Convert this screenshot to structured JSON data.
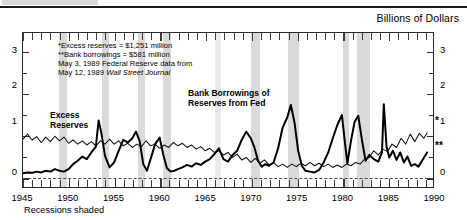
{
  "header": {
    "units_label": "Billions of Dollars"
  },
  "footer": {
    "recessions_note": "Recessions shaded"
  },
  "annotations": {
    "note_line1": "*Excess reserves = $1,251 million",
    "note_line2": "**Bank borrowings = $581 million",
    "note_line3": "May 3, 1989 Federal Reserve data from",
    "note_line4_prefix": "May 12, 1989 ",
    "note_line4_italic": "Wall Street Journal",
    "series_label_excess": "Excess",
    "series_label_excess2": "Reserves",
    "series_label_borrow": "Bank Borrowings of",
    "series_label_borrow2": "Reserves from Fed",
    "endmark_excess": "*",
    "endmark_borrow": "**"
  },
  "colors": {
    "line": "#000000",
    "recession_band": "#c3c3c3",
    "axis": "#2a2a2a",
    "background": "#ffffff"
  },
  "chart_data": {
    "type": "line",
    "title": "",
    "subtitle": "",
    "xlabel": "",
    "ylabel": "Billions of Dollars",
    "ylim": [
      -0.25,
      3.45
    ],
    "xlim": [
      1945,
      1990
    ],
    "grid": false,
    "legend": "inline-annotations",
    "yticks": [
      0,
      1,
      2,
      3
    ],
    "yticks_minor": [
      0.5,
      1.5,
      2.5
    ],
    "xticks": [
      1945,
      1950,
      1955,
      1960,
      1965,
      1970,
      1975,
      1980,
      1985,
      1990
    ],
    "xticks_minor_step": 1,
    "zero_line": 0,
    "recessions": [
      {
        "start": 1948.9,
        "end": 1949.8
      },
      {
        "start": 1953.6,
        "end": 1954.4
      },
      {
        "start": 1957.6,
        "end": 1958.3
      },
      {
        "start": 1960.3,
        "end": 1961.2
      },
      {
        "start": 1966.0,
        "end": 1966.6,
        "light": true
      },
      {
        "start": 1969.9,
        "end": 1970.9
      },
      {
        "start": 1973.9,
        "end": 1975.2
      },
      {
        "start": 1980.0,
        "end": 1980.6
      },
      {
        "start": 1981.5,
        "end": 1982.9
      }
    ],
    "series": [
      {
        "name": "Excess Reserves",
        "style": "thin",
        "end_value": 1.251,
        "end_marker": "*",
        "x": [
          1945.0,
          1945.5,
          1946.0,
          1946.5,
          1947.0,
          1947.5,
          1948.0,
          1948.5,
          1949.0,
          1949.5,
          1950.0,
          1950.5,
          1951.0,
          1951.5,
          1952.0,
          1952.5,
          1953.0,
          1953.5,
          1954.0,
          1954.5,
          1955.0,
          1955.5,
          1956.0,
          1956.5,
          1957.0,
          1957.5,
          1958.0,
          1958.5,
          1959.0,
          1959.5,
          1960.0,
          1960.5,
          1961.0,
          1961.5,
          1962.0,
          1962.5,
          1963.0,
          1963.5,
          1964.0,
          1964.5,
          1965.0,
          1965.5,
          1966.0,
          1966.5,
          1967.0,
          1967.5,
          1968.0,
          1968.5,
          1969.0,
          1969.5,
          1970.0,
          1970.5,
          1971.0,
          1971.5,
          1972.0,
          1972.5,
          1973.0,
          1973.5,
          1974.0,
          1974.5,
          1975.0,
          1975.5,
          1976.0,
          1976.5,
          1977.0,
          1977.5,
          1978.0,
          1978.5,
          1979.0,
          1979.5,
          1980.0,
          1980.5,
          1981.0,
          1981.5,
          1982.0,
          1982.5,
          1983.0,
          1983.5,
          1984.0,
          1984.5,
          1985.0,
          1985.5,
          1986.0,
          1986.5,
          1987.0,
          1987.5,
          1988.0,
          1988.5,
          1989.0,
          1989.35
        ],
        "y": [
          0.9,
          1.02,
          0.88,
          0.96,
          0.82,
          0.95,
          0.84,
          0.97,
          0.86,
          0.95,
          0.8,
          0.88,
          0.78,
          0.86,
          0.76,
          0.84,
          0.74,
          0.86,
          0.78,
          0.9,
          0.78,
          0.86,
          0.74,
          0.8,
          0.7,
          0.78,
          0.72,
          0.86,
          0.74,
          0.78,
          0.68,
          0.76,
          0.7,
          0.82,
          0.74,
          0.8,
          0.7,
          0.76,
          0.66,
          0.72,
          0.62,
          0.68,
          0.58,
          0.62,
          0.52,
          0.58,
          0.46,
          0.54,
          0.4,
          0.46,
          0.34,
          0.44,
          0.32,
          0.4,
          0.28,
          0.34,
          0.24,
          0.3,
          0.22,
          0.3,
          0.24,
          0.32,
          0.26,
          0.34,
          0.26,
          0.32,
          0.24,
          0.3,
          0.22,
          0.28,
          0.22,
          0.3,
          0.26,
          0.34,
          0.3,
          0.42,
          0.46,
          0.62,
          0.52,
          0.66,
          0.6,
          0.78,
          0.7,
          0.92,
          0.78,
          1.02,
          0.84,
          1.04,
          0.92,
          1.05
        ]
      },
      {
        "name": "Bank Borrowings of Reserves from Fed",
        "style": "thick",
        "end_value": 0.581,
        "end_marker": "**",
        "x": [
          1945.0,
          1945.5,
          1946.0,
          1946.5,
          1947.0,
          1947.5,
          1948.0,
          1948.5,
          1949.0,
          1949.5,
          1950.0,
          1950.5,
          1951.0,
          1951.5,
          1952.0,
          1952.5,
          1953.0,
          1953.3,
          1953.6,
          1954.0,
          1954.5,
          1955.0,
          1955.5,
          1956.0,
          1956.5,
          1957.0,
          1957.4,
          1957.8,
          1958.2,
          1958.6,
          1959.0,
          1959.5,
          1960.0,
          1960.4,
          1960.8,
          1961.2,
          1961.6,
          1962.0,
          1962.5,
          1963.0,
          1963.5,
          1964.0,
          1964.5,
          1965.0,
          1965.5,
          1966.0,
          1966.5,
          1967.0,
          1967.5,
          1968.0,
          1968.5,
          1969.0,
          1969.5,
          1970.0,
          1970.4,
          1970.8,
          1971.2,
          1971.6,
          1972.0,
          1972.5,
          1973.0,
          1973.5,
          1974.0,
          1974.4,
          1974.8,
          1975.2,
          1975.6,
          1976.0,
          1976.5,
          1977.0,
          1977.5,
          1978.0,
          1978.5,
          1979.0,
          1979.5,
          1980.0,
          1980.3,
          1980.6,
          1981.0,
          1981.4,
          1981.8,
          1982.2,
          1982.6,
          1983.0,
          1983.5,
          1984.0,
          1984.4,
          1984.6,
          1984.9,
          1985.2,
          1985.6,
          1986.0,
          1986.4,
          1986.8,
          1987.2,
          1987.6,
          1988.0,
          1988.4,
          1988.8,
          1989.35
        ],
        "y": [
          0.08,
          0.1,
          0.09,
          0.12,
          0.1,
          0.14,
          0.12,
          0.18,
          0.14,
          0.12,
          0.18,
          0.3,
          0.38,
          0.48,
          0.42,
          0.58,
          0.72,
          1.35,
          1.05,
          0.5,
          0.22,
          0.34,
          0.62,
          0.88,
          0.82,
          0.92,
          1.08,
          0.86,
          0.3,
          0.14,
          0.42,
          0.78,
          0.94,
          0.52,
          0.2,
          0.12,
          0.14,
          0.18,
          0.22,
          0.28,
          0.24,
          0.32,
          0.28,
          0.36,
          0.42,
          0.54,
          0.68,
          0.42,
          0.36,
          0.52,
          0.62,
          0.88,
          1.08,
          0.92,
          0.7,
          0.38,
          0.24,
          0.3,
          0.26,
          0.34,
          0.68,
          1.18,
          1.42,
          1.72,
          1.3,
          0.62,
          0.26,
          0.14,
          0.12,
          0.1,
          0.16,
          0.34,
          0.58,
          0.92,
          1.24,
          1.48,
          0.88,
          0.32,
          0.86,
          1.32,
          1.46,
          0.88,
          0.38,
          0.52,
          0.42,
          0.36,
          0.58,
          1.74,
          0.72,
          0.46,
          0.62,
          0.4,
          0.58,
          0.34,
          0.48,
          0.26,
          0.3,
          0.24,
          0.38,
          0.58
        ]
      }
    ]
  }
}
